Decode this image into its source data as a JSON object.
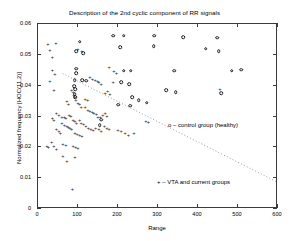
{
  "chart_data": {
    "type": "scatter",
    "title": "Description of the 2nd cyclic component of RR signals",
    "xlabel": "Range",
    "ylabel": "Normalized frequency [HOC(11,2)]",
    "xlim": [
      0,
      600
    ],
    "ylim": [
      0,
      0.06
    ],
    "xticks": [
      "0",
      "100",
      "200",
      "300",
      "400",
      "500",
      "600"
    ],
    "xtick_values": [
      0,
      100,
      200,
      300,
      400,
      500,
      600
    ],
    "yticks": [
      "0",
      "0.01",
      "0.02",
      "0.03",
      "0.04",
      "0.05",
      "0.06"
    ],
    "ytick_values": [
      0,
      0.01,
      0.02,
      0.03,
      0.04,
      0.05,
      0.06
    ],
    "grid": false,
    "legend_position": "inside-right",
    "legend": [
      {
        "marker": "o",
        "label": "o  –  control group (healthy)"
      },
      {
        "marker": "+",
        "label": "+  –  VTA and current groups"
      }
    ],
    "annotations": [
      {
        "type": "dotted-trend-line",
        "x0": 62,
        "y0": 0.0438,
        "x1": 600,
        "y1": 0.0085
      }
    ],
    "series": [
      {
        "name": "control group (healthy)",
        "marker": "o",
        "points": [
          [
            188,
            0.0562
          ],
          [
            214,
            0.0562
          ],
          [
            290,
            0.0562
          ],
          [
            363,
            0.0558
          ],
          [
            448,
            0.0555
          ],
          [
            205,
            0.0525
          ],
          [
            289,
            0.0528
          ],
          [
            419,
            0.052
          ],
          [
            452,
            0.0512
          ],
          [
            104,
            0.0542
          ],
          [
            96,
            0.0512
          ],
          [
            113,
            0.0505
          ],
          [
            95,
            0.0455
          ],
          [
            96,
            0.044
          ],
          [
            214,
            0.0448
          ],
          [
            232,
            0.0448
          ],
          [
            340,
            0.0448
          ],
          [
            484,
            0.0448
          ],
          [
            508,
            0.0452
          ],
          [
            92,
            0.0418
          ],
          [
            110,
            0.0418
          ],
          [
            120,
            0.0416
          ],
          [
            208,
            0.0412
          ],
          [
            228,
            0.0405
          ],
          [
            90,
            0.0398
          ],
          [
            93,
            0.0388
          ],
          [
            320,
            0.0385
          ],
          [
            344,
            0.0378
          ],
          [
            458,
            0.0375
          ],
          [
            92,
            0.0372
          ],
          [
            93,
            0.0362
          ],
          [
            236,
            0.0362
          ],
          [
            252,
            0.0352
          ],
          [
            272,
            0.0345
          ],
          [
            200,
            0.0338
          ],
          [
            230,
            0.0335
          ],
          [
            158,
            0.029
          ],
          [
            154,
            0.0272
          ]
        ]
      },
      {
        "name": "VTA and current groups",
        "marker": "+",
        "points": [
          [
            25,
            0.0535
          ],
          [
            30,
            0.0515
          ],
          [
            45,
            0.0538
          ],
          [
            36,
            0.0492
          ],
          [
            100,
            0.052
          ],
          [
            110,
            0.0512
          ],
          [
            36,
            0.0452
          ],
          [
            42,
            0.0438
          ],
          [
            30,
            0.0415
          ],
          [
            178,
            0.046
          ],
          [
            190,
            0.0448
          ],
          [
            196,
            0.044
          ],
          [
            130,
            0.0428
          ],
          [
            136,
            0.0422
          ],
          [
            143,
            0.0418
          ],
          [
            149,
            0.0415
          ],
          [
            152,
            0.0412
          ],
          [
            158,
            0.0405
          ],
          [
            188,
            0.0412
          ],
          [
            40,
            0.0385
          ],
          [
            84,
            0.0385
          ],
          [
            88,
            0.0378
          ],
          [
            90,
            0.037
          ],
          [
            92,
            0.0362
          ],
          [
            95,
            0.0352
          ],
          [
            100,
            0.0345
          ],
          [
            104,
            0.034
          ],
          [
            108,
            0.0332
          ],
          [
            72,
            0.035
          ],
          [
            76,
            0.0342
          ],
          [
            174,
            0.0382
          ],
          [
            168,
            0.0375
          ],
          [
            180,
            0.0372
          ],
          [
            118,
            0.033
          ],
          [
            125,
            0.0322
          ],
          [
            130,
            0.0318
          ],
          [
            136,
            0.0315
          ],
          [
            140,
            0.0312
          ],
          [
            146,
            0.0308
          ],
          [
            46,
            0.0312
          ],
          [
            52,
            0.0305
          ],
          [
            60,
            0.03
          ],
          [
            66,
            0.0298
          ],
          [
            70,
            0.0296
          ],
          [
            78,
            0.0305
          ],
          [
            82,
            0.0302
          ],
          [
            36,
            0.0295
          ],
          [
            40,
            0.0288
          ],
          [
            150,
            0.03
          ],
          [
            156,
            0.0298
          ],
          [
            162,
            0.0305
          ],
          [
            168,
            0.031
          ],
          [
            172,
            0.0302
          ],
          [
            88,
            0.029
          ],
          [
            92,
            0.0285
          ],
          [
            96,
            0.028
          ],
          [
            104,
            0.0288
          ],
          [
            108,
            0.0278
          ],
          [
            114,
            0.0275
          ],
          [
            60,
            0.0278
          ],
          [
            66,
            0.0272
          ],
          [
            72,
            0.0268
          ],
          [
            76,
            0.0265
          ],
          [
            80,
            0.0262
          ],
          [
            84,
            0.0258
          ],
          [
            120,
            0.0268
          ],
          [
            126,
            0.0262
          ],
          [
            132,
            0.0258
          ],
          [
            138,
            0.0255
          ],
          [
            144,
            0.0262
          ],
          [
            152,
            0.0258
          ],
          [
            158,
            0.0252
          ],
          [
            46,
            0.0258
          ],
          [
            52,
            0.0252
          ],
          [
            56,
            0.0248
          ],
          [
            92,
            0.0248
          ],
          [
            98,
            0.0242
          ],
          [
            104,
            0.024
          ],
          [
            110,
            0.0238
          ],
          [
            166,
            0.0268
          ],
          [
            172,
            0.0262
          ],
          [
            178,
            0.0258
          ],
          [
            200,
            0.0255
          ],
          [
            208,
            0.0252
          ],
          [
            218,
            0.0248
          ],
          [
            240,
            0.0245
          ],
          [
            226,
            0.024
          ],
          [
            22,
            0.0205
          ],
          [
            26,
            0.0202
          ],
          [
            34,
            0.0218
          ],
          [
            40,
            0.0205
          ],
          [
            46,
            0.0195
          ],
          [
            62,
            0.0212
          ],
          [
            70,
            0.0208
          ],
          [
            88,
            0.0205
          ],
          [
            94,
            0.02
          ],
          [
            100,
            0.0198
          ],
          [
            62,
            0.0172
          ],
          [
            72,
            0.0155
          ],
          [
            92,
            0.0168
          ],
          [
            86,
            0.0065
          ],
          [
            270,
            0.0285
          ],
          [
            276,
            0.0282
          ],
          [
            455,
            0.0388
          ],
          [
            118,
            0.0358
          ],
          [
            124,
            0.0352
          ]
        ]
      }
    ]
  }
}
